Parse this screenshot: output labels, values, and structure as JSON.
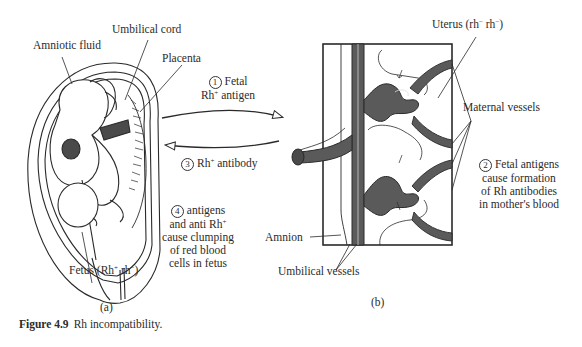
{
  "figure": {
    "caption_label": "Figure 4.9",
    "caption_text": "Rh incompatibility."
  },
  "panel_a": {
    "sublabel": "(a)",
    "labels": {
      "amniotic_fluid": "Amniotic fluid",
      "umbilical_cord": "Umbilical cord",
      "placenta": "Placenta",
      "fetus": "Fetus (Rh",
      "fetus_sup1": "+",
      "fetus_mid": "rh",
      "fetus_sup2": "−",
      "fetus_end": ")"
    }
  },
  "steps": [
    {
      "number": "1",
      "line1": "Fetal",
      "line2_pre": "Rh",
      "line2_sup": "+",
      "line2_post": "antigen"
    },
    {
      "number": "2",
      "line1": "Fetal antigens",
      "line2": "cause formation",
      "line3": "of Rh antibodies",
      "line4": "in mother's blood"
    },
    {
      "number": "3",
      "pre": "Rh",
      "sup": "+",
      "post": "antibody"
    },
    {
      "number": "4",
      "line1": "antigens",
      "line2_pre": "and anti Rh",
      "line2_sup": "+",
      "line3": "cause clumping",
      "line4": "of red blood",
      "line5": "cells in fetus"
    }
  ],
  "panel_b": {
    "sublabel": "(b)",
    "labels": {
      "uterus_pre": "Uterus (rh",
      "uterus_sup1": "−",
      "uterus_mid": "rh",
      "uterus_sup2": "−",
      "uterus_end": ")",
      "maternal_vessels": "Maternal vessels",
      "amnion": "Amnion",
      "umbilical_vessels": "Umbilical vessels"
    }
  },
  "colors": {
    "line": "#2a2a2a",
    "vessel_fill": "#5a5a5a",
    "background": "#ffffff"
  }
}
